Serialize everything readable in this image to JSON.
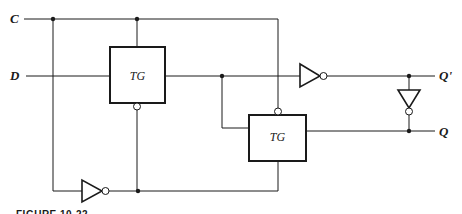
{
  "figure": {
    "caption": "FIGURE 10-22",
    "inputs": [
      {
        "id": "C",
        "label": "C"
      },
      {
        "id": "D",
        "label": "D"
      }
    ],
    "outputs": [
      {
        "id": "Qp",
        "label": "Q'"
      },
      {
        "id": "Q",
        "label": "Q"
      }
    ],
    "blocks": [
      {
        "id": "tg1",
        "label": "TG"
      },
      {
        "id": "tg2",
        "label": "TG"
      }
    ],
    "colors": {
      "ink": "#1a1a1a",
      "background": "#ffffff"
    }
  }
}
